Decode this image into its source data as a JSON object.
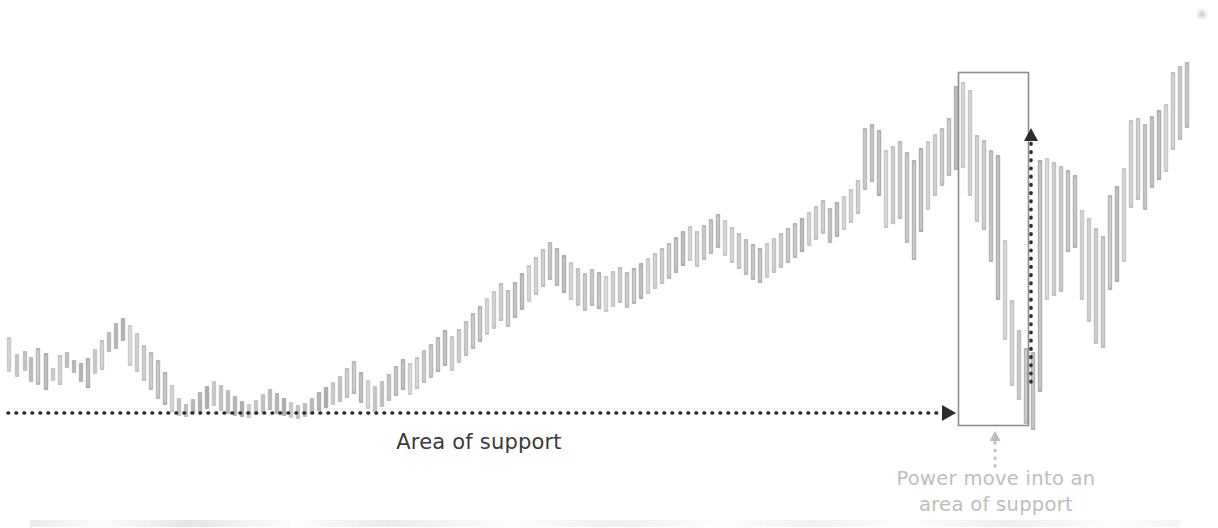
{
  "figure": {
    "background_color": "#ffffff",
    "candle_color": "#9a9a9a",
    "annotation_dark_color": "#3a3a3a",
    "annotation_light_color": "#bdbdbd",
    "box_color": "#8d8d8d"
  },
  "annotations": {
    "support_label": "Area of support",
    "power_move_line1": "Power move into an",
    "power_move_line2": "area of support"
  },
  "chart_data": {
    "type": "bar",
    "title": "",
    "subtitle": "",
    "xlabel": "",
    "ylabel": "",
    "grid": false,
    "legend": null,
    "axis_visible": false,
    "xlim": [
      0,
      200
    ],
    "ylim": [
      0,
      528
    ],
    "support_line": {
      "label": "Area of support",
      "y_pixel": 413,
      "x_start_pixel": 8,
      "x_end_pixel": 956,
      "style": "dotted",
      "arrow": "right",
      "color": "#2e2e2e"
    },
    "highlight_box": {
      "label": "Power move into an area of support",
      "x_pixel": 958,
      "y_pixel": 72,
      "width_pixel": 70,
      "height_pixel": 353,
      "style": "solid-thin",
      "color": "#8d8d8d"
    },
    "move_arrow": {
      "orientation": "vertical",
      "style": "dotted",
      "arrow": "up",
      "x_pixel": 1031,
      "y_top_pixel": 128,
      "y_bottom_pixel": 382,
      "color": "#2e2e2e"
    },
    "caption_connector": {
      "orientation": "vertical",
      "style": "dotted",
      "arrow": "up",
      "x_pixel": 995,
      "y_top_pixel": 431,
      "y_bottom_pixel": 466,
      "color": "#bdbdbd"
    },
    "series": [
      {
        "name": "Price bars",
        "note": "Each entry is [x_center_px, high_px, low_px] in screen coordinates; lower y = higher price.",
        "bars": [
          [
            9,
            337,
            372
          ],
          [
            17,
            354,
            377
          ],
          [
            25,
            351,
            371
          ],
          [
            31,
            357,
            382
          ],
          [
            38,
            348,
            385
          ],
          [
            46,
            353,
            390
          ],
          [
            53,
            368,
            381
          ],
          [
            60,
            355,
            385
          ],
          [
            67,
            352,
            368
          ],
          [
            74,
            360,
            373
          ],
          [
            81,
            363,
            382
          ],
          [
            88,
            358,
            388
          ],
          [
            95,
            349,
            374
          ],
          [
            102,
            340,
            370
          ],
          [
            109,
            332,
            352
          ],
          [
            116,
            323,
            349
          ],
          [
            123,
            318,
            341
          ],
          [
            130,
            325,
            366
          ],
          [
            137,
            333,
            372
          ],
          [
            144,
            345,
            381
          ],
          [
            151,
            352,
            390
          ],
          [
            158,
            360,
            399
          ],
          [
            165,
            372,
            405
          ],
          [
            172,
            385,
            412
          ],
          [
            179,
            398,
            416
          ],
          [
            186,
            404,
            417
          ],
          [
            193,
            399,
            414
          ],
          [
            200,
            392,
            412
          ],
          [
            207,
            386,
            409
          ],
          [
            214,
            381,
            406
          ],
          [
            221,
            385,
            411
          ],
          [
            228,
            390,
            414
          ],
          [
            235,
            396,
            416
          ],
          [
            242,
            401,
            417
          ],
          [
            249,
            404,
            418
          ],
          [
            256,
            400,
            415
          ],
          [
            263,
            394,
            413
          ],
          [
            270,
            389,
            410
          ],
          [
            277,
            393,
            414
          ],
          [
            284,
            398,
            416
          ],
          [
            291,
            402,
            418
          ],
          [
            298,
            405,
            419
          ],
          [
            305,
            403,
            417
          ],
          [
            312,
            398,
            414
          ],
          [
            319,
            392,
            411
          ],
          [
            326,
            387,
            408
          ],
          [
            333,
            382,
            405
          ],
          [
            340,
            376,
            402
          ],
          [
            347,
            368,
            398
          ],
          [
            354,
            361,
            394
          ],
          [
            361,
            372,
            403
          ],
          [
            368,
            380,
            409
          ],
          [
            375,
            386,
            412
          ],
          [
            382,
            381,
            407
          ],
          [
            389,
            374,
            401
          ],
          [
            396,
            366,
            396
          ],
          [
            403,
            359,
            390
          ],
          [
            410,
            363,
            395
          ],
          [
            417,
            357,
            389
          ],
          [
            424,
            350,
            383
          ],
          [
            431,
            344,
            378
          ],
          [
            438,
            337,
            372
          ],
          [
            445,
            330,
            366
          ],
          [
            452,
            336,
            371
          ],
          [
            459,
            329,
            363
          ],
          [
            466,
            321,
            356
          ],
          [
            473,
            313,
            349
          ],
          [
            480,
            306,
            342
          ],
          [
            487,
            298,
            335
          ],
          [
            494,
            291,
            329
          ],
          [
            501,
            283,
            321
          ],
          [
            508,
            290,
            327
          ],
          [
            515,
            282,
            318
          ],
          [
            522,
            273,
            310
          ],
          [
            529,
            265,
            302
          ],
          [
            536,
            257,
            295
          ],
          [
            543,
            249,
            287
          ],
          [
            550,
            242,
            280
          ],
          [
            557,
            248,
            286
          ],
          [
            564,
            255,
            293
          ],
          [
            571,
            262,
            300
          ],
          [
            578,
            268,
            306
          ],
          [
            585,
            273,
            311
          ],
          [
            592,
            269,
            306
          ],
          [
            599,
            272,
            309
          ],
          [
            606,
            276,
            312
          ],
          [
            613,
            271,
            307
          ],
          [
            620,
            267,
            303
          ],
          [
            627,
            272,
            308
          ],
          [
            634,
            268,
            304
          ],
          [
            641,
            263,
            299
          ],
          [
            648,
            258,
            294
          ],
          [
            655,
            253,
            289
          ],
          [
            662,
            248,
            284
          ],
          [
            669,
            243,
            279
          ],
          [
            676,
            237,
            273
          ],
          [
            683,
            231,
            266
          ],
          [
            690,
            226,
            261
          ],
          [
            697,
            231,
            267
          ],
          [
            704,
            225,
            260
          ],
          [
            711,
            219,
            254
          ],
          [
            718,
            214,
            248
          ],
          [
            725,
            220,
            256
          ],
          [
            732,
            227,
            263
          ],
          [
            739,
            233,
            269
          ],
          [
            746,
            239,
            275
          ],
          [
            753,
            244,
            280
          ],
          [
            760,
            248,
            283
          ],
          [
            767,
            243,
            278
          ],
          [
            774,
            238,
            273
          ],
          [
            781,
            233,
            268
          ],
          [
            788,
            228,
            263
          ],
          [
            795,
            223,
            258
          ],
          [
            802,
            218,
            252
          ],
          [
            809,
            212,
            246
          ],
          [
            816,
            206,
            240
          ],
          [
            823,
            200,
            234
          ],
          [
            830,
            208,
            243
          ],
          [
            837,
            202,
            237
          ],
          [
            844,
            196,
            230
          ],
          [
            851,
            189,
            223
          ],
          [
            858,
            180,
            214
          ],
          [
            865,
            128,
            190
          ],
          [
            872,
            124,
            182
          ],
          [
            879,
            130,
            196
          ],
          [
            886,
            150,
            228
          ],
          [
            893,
            146,
            224
          ],
          [
            900,
            141,
            219
          ],
          [
            907,
            152,
            243
          ],
          [
            914,
            160,
            260
          ],
          [
            921,
            148,
            232
          ],
          [
            928,
            141,
            210
          ],
          [
            935,
            134,
            196
          ],
          [
            942,
            128,
            186
          ],
          [
            949,
            118,
            176
          ],
          [
            956,
            86,
            170
          ],
          [
            963,
            82,
            168
          ],
          [
            970,
            90,
            196
          ],
          [
            977,
            135,
            222
          ],
          [
            984,
            140,
            230
          ],
          [
            991,
            150,
            262
          ],
          [
            998,
            155,
            300
          ],
          [
            1005,
            240,
            340
          ],
          [
            1012,
            300,
            386
          ],
          [
            1019,
            330,
            400
          ],
          [
            1026,
            348,
            424
          ],
          [
            1033,
            352,
            430
          ],
          [
            1040,
            160,
            392
          ],
          [
            1047,
            158,
            300
          ],
          [
            1054,
            162,
            296
          ],
          [
            1061,
            166,
            292
          ],
          [
            1068,
            170,
            252
          ],
          [
            1075,
            175,
            248
          ],
          [
            1082,
            210,
            300
          ],
          [
            1089,
            218,
            322
          ],
          [
            1096,
            228,
            344
          ],
          [
            1103,
            236,
            348
          ],
          [
            1110,
            195,
            290
          ],
          [
            1117,
            186,
            282
          ],
          [
            1124,
            168,
            262
          ],
          [
            1131,
            120,
            208
          ],
          [
            1138,
            118,
            200
          ],
          [
            1145,
            124,
            210
          ],
          [
            1152,
            116,
            188
          ],
          [
            1159,
            110,
            180
          ],
          [
            1166,
            104,
            172
          ],
          [
            1173,
            72,
            150
          ],
          [
            1180,
            66,
            140
          ],
          [
            1187,
            62,
            128
          ]
        ]
      }
    ]
  }
}
